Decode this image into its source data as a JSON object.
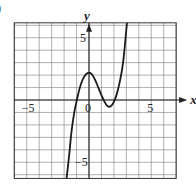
{
  "chart_data": {
    "type": "line",
    "title": "",
    "part_label": ")",
    "xlabel": "x",
    "ylabel": "y",
    "xlim": [
      -6,
      7
    ],
    "ylim": [
      -6.3,
      6.2
    ],
    "grid": true,
    "grid_step": 1,
    "x_tick_labels": [
      {
        "value": -5,
        "label": "−5"
      },
      {
        "value": 0,
        "label": "0"
      },
      {
        "value": 5,
        "label": "5"
      }
    ],
    "y_tick_labels": [
      {
        "value": 5,
        "label": "5"
      },
      {
        "value": -5,
        "label": "−5"
      }
    ],
    "series": [
      {
        "name": "f(x)",
        "points": [
          [
            -1.8,
            -6.3
          ],
          [
            -1.6,
            -4.5
          ],
          [
            -1.4,
            -2.5
          ],
          [
            -1.2,
            -1.1
          ],
          [
            -1.0,
            -0.1
          ],
          [
            -0.75,
            0.95
          ],
          [
            -0.5,
            1.65
          ],
          [
            -0.25,
            2.05
          ],
          [
            0.0,
            2.2
          ],
          [
            0.25,
            2.05
          ],
          [
            0.5,
            1.6
          ],
          [
            0.75,
            1.0
          ],
          [
            1.0,
            0.4
          ],
          [
            1.25,
            -0.15
          ],
          [
            1.5,
            -0.5
          ],
          [
            1.75,
            -0.5
          ],
          [
            2.0,
            -0.15
          ],
          [
            2.25,
            0.55
          ],
          [
            2.5,
            1.6
          ],
          [
            2.75,
            3.1
          ],
          [
            3.05,
            6.2
          ]
        ]
      }
    ]
  }
}
